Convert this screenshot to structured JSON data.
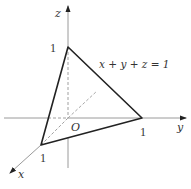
{
  "diagram": {
    "type": "3d-coordinate-plane",
    "axes": {
      "x": {
        "label": "x"
      },
      "y": {
        "label": "y"
      },
      "z": {
        "label": "z"
      }
    },
    "origin_label": "O",
    "plane_equation": "x + y + z = 1",
    "intercepts": [
      {
        "axis": "x",
        "value": "1",
        "point": [
          1,
          0,
          0
        ]
      },
      {
        "axis": "y",
        "value": "1",
        "point": [
          0,
          1,
          0
        ]
      },
      {
        "axis": "z",
        "value": "1",
        "point": [
          0,
          0,
          1
        ]
      }
    ],
    "colors": {
      "triangle_edge": "#222222",
      "axis": "#9a9a9a",
      "dashed": "#a0a0a0",
      "text": "#333333"
    }
  }
}
